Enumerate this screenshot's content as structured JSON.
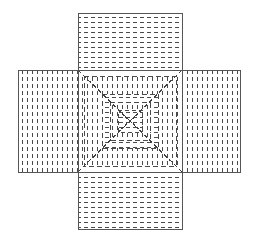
{
  "figure": {
    "name": "cross-shaped-unfolded-box-net",
    "canvas": {
      "width": 258,
      "height": 244,
      "background": "#ffffff"
    }
  },
  "style": {
    "outline_color": "#555555",
    "hatch_color": "#4a4a4a",
    "diagonal_color": "#3f3f3f",
    "outline_width": 1,
    "hatch_width": 1.1,
    "dash_pattern_hatch": "4,3",
    "dash_pattern_center": "5,3",
    "dash_pattern_diagonal": "4,3"
  },
  "geometry": {
    "center_panel": {
      "x": 78,
      "y": 70,
      "width": 104,
      "height": 102
    },
    "top_panel": {
      "x": 78,
      "y": 13,
      "width": 104,
      "height": 57
    },
    "bottom_panel": {
      "x": 78,
      "y": 172,
      "width": 104,
      "height": 57
    },
    "left_panel": {
      "x": 18,
      "y": 70,
      "width": 60,
      "height": 102
    },
    "right_panel": {
      "x": 182,
      "y": 70,
      "width": 58,
      "height": 102
    }
  },
  "panels": [
    {
      "id": "top-flap",
      "label": "Top flap",
      "hatch": "horizontal",
      "hatch_spacing": 5,
      "dash": "4,3"
    },
    {
      "id": "bottom-flap",
      "label": "Bottom flap",
      "hatch": "horizontal",
      "hatch_spacing": 5,
      "dash": "4,3"
    },
    {
      "id": "left-flap",
      "label": "Left flap",
      "hatch": "vertical",
      "hatch_spacing": 5,
      "dash": "4,3"
    },
    {
      "id": "right-flap",
      "label": "Right flap",
      "hatch": "vertical",
      "hatch_spacing": 5,
      "dash": "4,3"
    },
    {
      "id": "center-panel",
      "label": "Center pyramidal panel",
      "hatch": "concentric-rings-with-diagonals",
      "ring_count": 4,
      "ring_insets": [
        6,
        28,
        36,
        44
      ],
      "dash": "5,3"
    }
  ],
  "center_detail": {
    "rings": [
      {
        "index": 0,
        "inset": 4,
        "hatch": "vertical",
        "spacing": 5
      },
      {
        "index": 1,
        "inset": 24,
        "hatch": "horizontal",
        "spacing": 5
      },
      {
        "index": 2,
        "inset": 32,
        "hatch": "vertical",
        "spacing": 4
      },
      {
        "index": 3,
        "inset": 40,
        "hatch": "horizontal",
        "spacing": 4
      }
    ],
    "diagonals": [
      {
        "from": "top-left",
        "to": "center"
      },
      {
        "from": "top-right",
        "to": "center"
      },
      {
        "from": "bottom-left",
        "to": "center"
      },
      {
        "from": "bottom-right",
        "to": "center"
      }
    ],
    "inner_x_cross": true,
    "inner_square": {
      "x": 118,
      "y": 110,
      "width": 22,
      "height": 22
    }
  },
  "labels": {
    "title": "",
    "caption": "",
    "annotations": []
  }
}
